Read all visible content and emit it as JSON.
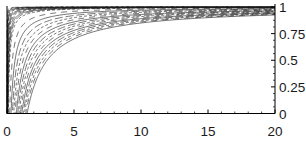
{
  "chart_data": {
    "type": "line",
    "title": "",
    "xlabel": "",
    "ylabel": "",
    "x_range": [
      0,
      20
    ],
    "y_range": [
      0,
      1
    ],
    "grid": false,
    "legend": null,
    "axes": {
      "x_axis_position": "bottom",
      "y_axis_position": "right",
      "left_edge_line_x": 0
    },
    "x_ticks": {
      "values": [
        0,
        5,
        10,
        15,
        20
      ],
      "labels": [
        "0",
        "5",
        "10",
        "15",
        "20"
      ],
      "minor_step": 1
    },
    "y_ticks": {
      "values": [
        0,
        0.25,
        0.5,
        0.75,
        1
      ],
      "labels": [
        "0",
        "0.25",
        "0.5",
        "0.75",
        "1"
      ],
      "minor_step": 0.0625
    },
    "series_family": {
      "formula": "y = 1 - a/x",
      "style": "dense bundle of thin dashed black curves, lower envelope a = 1.5",
      "a_values": [
        1.5,
        1.4,
        1.3,
        1.2,
        1.1,
        1.0,
        0.9,
        0.8,
        0.7,
        0.6,
        0.5,
        0.4,
        0.3,
        0.2,
        0.1,
        0.08,
        0.065,
        0.052,
        0.042,
        0.034,
        0.027,
        0.021,
        0.016,
        0.012,
        0.009,
        0.006,
        0.004,
        0.002
      ]
    },
    "colors": {
      "curve": "#1c1c1c",
      "axis": "#000000",
      "label": "#1a1a1a",
      "background": "#ffffff"
    }
  }
}
